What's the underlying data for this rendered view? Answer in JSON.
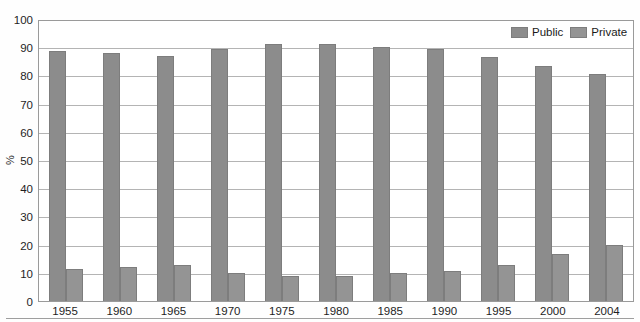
{
  "chart_data": {
    "type": "bar",
    "title": "",
    "xlabel": "",
    "ylabel": "%",
    "ylim": [
      0,
      100
    ],
    "ytick_step": 10,
    "grid": true,
    "legend_position": "top-right",
    "categories": [
      "1955",
      "1960",
      "1965",
      "1970",
      "1975",
      "1980",
      "1985",
      "1990",
      "1995",
      "2000",
      "2004"
    ],
    "series": [
      {
        "name": "Public",
        "color": "#8c8c8c",
        "values": [
          88.5,
          88.0,
          87.0,
          89.5,
          91.0,
          91.0,
          90.0,
          89.5,
          86.5,
          83.5,
          80.5
        ]
      },
      {
        "name": "Private",
        "color": "#949494",
        "values": [
          11.5,
          12.0,
          12.8,
          10.0,
          8.8,
          9.0,
          10.0,
          10.5,
          12.8,
          16.5,
          19.8
        ]
      }
    ],
    "yticks": [
      "100",
      "90",
      "80",
      "70",
      "60",
      "50",
      "40",
      "30",
      "20",
      "10",
      "0"
    ]
  },
  "legend": {
    "entries": [
      {
        "label": "Public"
      },
      {
        "label": "Private"
      }
    ]
  }
}
